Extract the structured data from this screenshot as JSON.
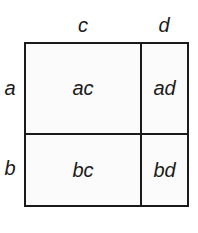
{
  "diagram": {
    "type": "area-model-multiplication",
    "column_labels": [
      "c",
      "d"
    ],
    "row_labels": [
      "a",
      "b"
    ],
    "cells": [
      [
        "ac",
        "ad"
      ],
      [
        "bc",
        "bd"
      ]
    ],
    "colors": {
      "line": "#1a1a1a",
      "fill": "#fbfbfb",
      "background": "#ffffff"
    }
  }
}
